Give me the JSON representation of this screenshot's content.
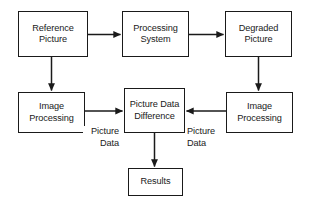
{
  "diagram": {
    "type": "flowchart",
    "style": {
      "background_color": "#ffffff",
      "stroke_color": "#1a1a1a",
      "text_color": "#1a1a1a",
      "box_fill": "#ffffff"
    },
    "nodes": [
      {
        "id": "reference-picture",
        "lines": [
          "Reference",
          "Picture"
        ],
        "x": 18,
        "y": 11,
        "w": 70,
        "h": 46
      },
      {
        "id": "processing-system",
        "lines": [
          "Processing",
          "System"
        ],
        "x": 122,
        "y": 11,
        "w": 67,
        "h": 46
      },
      {
        "id": "degraded-picture",
        "lines": [
          "Degraded",
          "Picture"
        ],
        "x": 225,
        "y": 11,
        "w": 67,
        "h": 46
      },
      {
        "id": "image-processing-left",
        "lines": [
          "Image",
          "Processing"
        ],
        "x": 18,
        "y": 92,
        "w": 67,
        "h": 41
      },
      {
        "id": "picture-data-difference",
        "lines": [
          "Picture Data",
          "Difference"
        ],
        "x": 124,
        "y": 88,
        "w": 61,
        "h": 45
      },
      {
        "id": "image-processing-right",
        "lines": [
          "Image",
          "Processing"
        ],
        "x": 226,
        "y": 92,
        "w": 67,
        "h": 41
      },
      {
        "id": "results",
        "lines": [
          "Results"
        ],
        "x": 128,
        "y": 168,
        "w": 55,
        "h": 28
      }
    ],
    "edge_labels": [
      {
        "id": "picture-data-left",
        "lines": [
          "Picture",
          "Data"
        ],
        "x": 83,
        "y": 126,
        "w": 36,
        "align": "right"
      },
      {
        "id": "picture-data-right",
        "lines": [
          "Picture",
          "Data"
        ],
        "x": 187,
        "y": 126,
        "w": 36,
        "align": "left"
      }
    ],
    "edges": [
      {
        "id": "reference-to-processing",
        "from": "reference-picture",
        "to": "processing-system",
        "direction": "right"
      },
      {
        "id": "processing-to-degraded",
        "from": "processing-system",
        "to": "degraded-picture",
        "direction": "right"
      },
      {
        "id": "reference-to-image-processing",
        "from": "reference-picture",
        "to": "image-processing-left",
        "direction": "down"
      },
      {
        "id": "degraded-to-image-processing",
        "from": "degraded-picture",
        "to": "image-processing-right",
        "direction": "down"
      },
      {
        "id": "left-processing-to-difference",
        "from": "image-processing-left",
        "to": "picture-data-difference",
        "direction": "right",
        "label": "picture-data-left"
      },
      {
        "id": "right-processing-to-difference",
        "from": "image-processing-right",
        "to": "picture-data-difference",
        "direction": "left",
        "label": "picture-data-right"
      },
      {
        "id": "difference-to-results",
        "from": "picture-data-difference",
        "to": "results",
        "direction": "down"
      }
    ]
  }
}
